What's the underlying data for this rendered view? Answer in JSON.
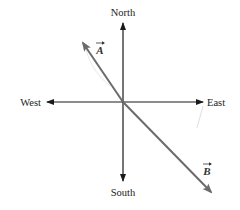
{
  "diagram": {
    "compass": {
      "north": "North",
      "south": "South",
      "east": "East",
      "west": "West"
    },
    "vectors": [
      {
        "label": "A",
        "direction": "northwest",
        "color": "#6b6b6b"
      },
      {
        "label": "B",
        "direction": "southeast",
        "color": "#6b6b6b"
      }
    ],
    "axis_color": "#1a1a1a"
  }
}
